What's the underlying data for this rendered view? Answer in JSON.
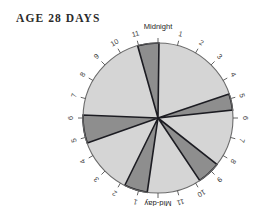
{
  "chart": {
    "title": "AGE 28 DAYS",
    "top_label": "Midnight",
    "bottom_label": "Mid-day"
  },
  "hour_ticks": {
    "right_upper": [
      "1",
      "2",
      "3",
      "4",
      "5"
    ],
    "right_lower": [
      "6",
      "7",
      "8",
      "9",
      "10",
      "11"
    ],
    "left_lower": [
      "1",
      "2",
      "3",
      "4",
      "5"
    ],
    "left_upper": [
      "6",
      "7",
      "8",
      "9",
      "10",
      "11"
    ]
  },
  "colors": {
    "background_segment": "#d5d5d5",
    "active_segment": "#8e8e8e",
    "segment_edge": "#1c1c22",
    "circle_outline": "#6a6a6a",
    "tick": "#555555",
    "title_text": "#2b2b2b",
    "label_text": "#262626",
    "page_background": "#ffffff"
  },
  "chart_data": {
    "type": "pie",
    "title": "AGE 28 DAYS",
    "subtitle": "",
    "xlabel": "",
    "ylabel": "",
    "legend_position": "none",
    "grid": false,
    "axis_note": "24-hour clock face; Midnight at top (0h), Mid-day at bottom (12h); hours increase clockwise",
    "total_hours": 24,
    "annotations": [
      "Midnight",
      "Mid-day"
    ],
    "tick_labels": [
      "Midnight",
      "1",
      "2",
      "3",
      "4",
      "5",
      "6",
      "7",
      "8",
      "9",
      "10",
      "11",
      "Mid-day",
      "1",
      "2",
      "3",
      "4",
      "5",
      "6",
      "7",
      "8",
      "9",
      "10",
      "11"
    ],
    "categories": [
      "23:00-00:05 sleep bout",
      "04:45-05:35 sleep bout",
      "08:35-09:45 sleep bout",
      "12:35-13:45 sleep bout",
      "16:45-18:10 sleep bout"
    ],
    "values": [
      1.1,
      0.85,
      1.2,
      1.2,
      1.4
    ],
    "series": [
      {
        "name": "Sleep bouts (dark wedges)",
        "units": "hours",
        "segments": [
          {
            "label": "bout-1",
            "start_hour": 22.95,
            "end_hour": 24.05,
            "duration_hours": 1.1,
            "center_hour": 23.5
          },
          {
            "label": "bout-2",
            "start_hour": 4.75,
            "end_hour": 5.6,
            "duration_hours": 0.85,
            "center_hour": 5.18
          },
          {
            "label": "bout-3",
            "start_hour": 8.55,
            "end_hour": 9.75,
            "duration_hours": 1.2,
            "center_hour": 9.15
          },
          {
            "label": "bout-4",
            "start_hour": 12.55,
            "end_hour": 13.75,
            "duration_hours": 1.2,
            "center_hour": 13.15
          },
          {
            "label": "bout-5",
            "start_hour": 16.7,
            "end_hour": 18.15,
            "duration_hours": 1.45,
            "center_hour": 17.43
          }
        ]
      },
      {
        "name": "Awake (light background)",
        "units": "hours",
        "segments": [
          {
            "label": "awake-1",
            "start_hour": 0.05,
            "end_hour": 4.75,
            "duration_hours": 4.7
          },
          {
            "label": "awake-2",
            "start_hour": 5.6,
            "end_hour": 8.55,
            "duration_hours": 2.95
          },
          {
            "label": "awake-3",
            "start_hour": 9.75,
            "end_hour": 12.55,
            "duration_hours": 2.8
          },
          {
            "label": "awake-4",
            "start_hour": 13.75,
            "end_hour": 16.7,
            "duration_hours": 2.95
          },
          {
            "label": "awake-5",
            "start_hour": 18.15,
            "end_hour": 22.95,
            "duration_hours": 4.8
          }
        ]
      }
    ]
  }
}
